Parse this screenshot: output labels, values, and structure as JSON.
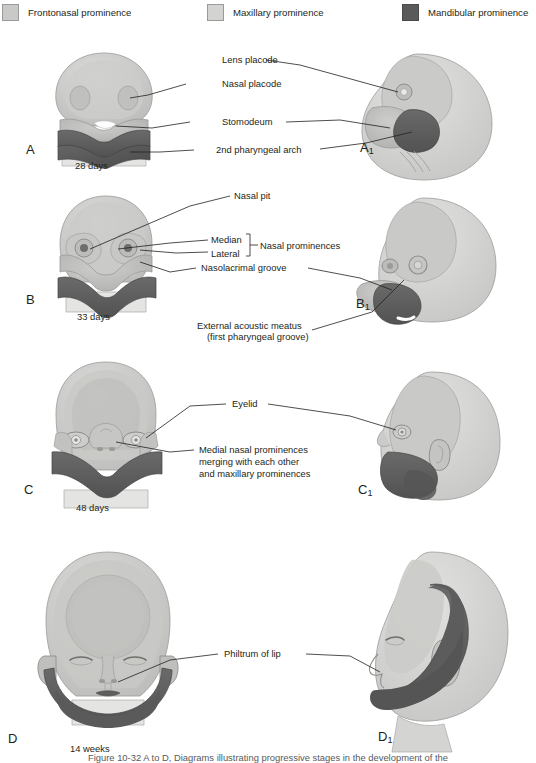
{
  "figure": {
    "caption_fragment": "Figure 10-32  A to D, Diagrams illustrating progressive stages in the development of the"
  },
  "legend": {
    "items": [
      {
        "label": "Frontonasal prominence",
        "color": "#c9c9c7",
        "swatch_name": "frontonasal-swatch"
      },
      {
        "label": "Maxillary prominence",
        "color": "#d3d3d1",
        "swatch_name": "maxillary-swatch"
      },
      {
        "label": "Mandibular prominence",
        "color": "#5a5a5a",
        "swatch_name": "mandibular-swatch"
      }
    ]
  },
  "colors": {
    "frontonasal": "#c4c4c2",
    "frontonasal_light": "#d8d8d6",
    "maxillary": "#b9b9b7",
    "maxillary_light": "#cfcfcd",
    "mandibular": "#5d5d5d",
    "mandibular_dark": "#4a4a4a",
    "outline": "#8a8a8a",
    "leader": "#231f20",
    "text": "#231f20",
    "white": "#ffffff",
    "shadow": "#a8a8a6"
  },
  "panels": [
    {
      "id": "A",
      "letter": "A",
      "view": "frontal",
      "stage": "28 days",
      "labels": [
        "Lens placode",
        "Nasal placode",
        "Stomodeum",
        "2nd pharyngeal arch"
      ]
    },
    {
      "id": "A1",
      "letter": "A",
      "subscript": "1",
      "view": "lateral",
      "stage": "28 days"
    },
    {
      "id": "B",
      "letter": "B",
      "view": "frontal",
      "stage": "33 days",
      "labels": [
        "Nasal pit",
        "Median",
        "Lateral",
        "Nasal prominences",
        "Nasolacrimal groove",
        "External acoustic meatus",
        "(first pharyngeal groove)"
      ]
    },
    {
      "id": "B1",
      "letter": "B",
      "subscript": "1",
      "view": "lateral",
      "stage": "33 days"
    },
    {
      "id": "C",
      "letter": "C",
      "view": "frontal",
      "stage": "48 days",
      "labels": [
        "Eyelid",
        "Medial nasal prominences",
        "merging with each other",
        "and maxillary prominences"
      ]
    },
    {
      "id": "C1",
      "letter": "C",
      "subscript": "1",
      "view": "lateral",
      "stage": "48 days"
    },
    {
      "id": "D",
      "letter": "D",
      "view": "frontal",
      "stage": "14 weeks",
      "labels": [
        "Philtrum of lip"
      ]
    },
    {
      "id": "D1",
      "letter": "D",
      "subscript": "1",
      "view": "lateral",
      "stage": "14 weeks"
    }
  ],
  "labels": {
    "lens_placode": "Lens placode",
    "nasal_placode": "Nasal placode",
    "stomodeum": "Stomodeum",
    "second_pharyngeal_arch": "2nd pharyngeal arch",
    "nasal_pit": "Nasal pit",
    "median": "Median",
    "lateral": "Lateral",
    "nasal_prominences": "Nasal prominences",
    "nasolacrimal_groove": "Nasolacrimal groove",
    "external_acoustic_meatus": "External acoustic meatus",
    "first_pharyngeal_groove": "(first pharyngeal groove)",
    "eyelid": "Eyelid",
    "medial_nasal_1": "Medial nasal prominences",
    "medial_nasal_2": "merging with each other",
    "medial_nasal_3": "and maxillary prominences",
    "philtrum": "Philtrum of lip"
  },
  "stages": {
    "a": "28 days",
    "b": "33 days",
    "c": "48 days",
    "d": "14 weeks"
  },
  "letters": {
    "a": "A",
    "a1": "A",
    "a1_sub": "1",
    "b": "B",
    "b1": "B",
    "b1_sub": "1",
    "c": "C",
    "c1": "C",
    "c1_sub": "1",
    "d": "D",
    "d1": "D",
    "d1_sub": "1"
  }
}
